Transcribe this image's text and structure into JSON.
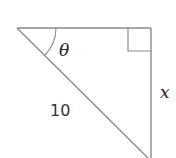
{
  "diagram": {
    "type": "right-triangle",
    "angle_label": "θ",
    "hypotenuse_label": "10",
    "opposite_label": "x",
    "stroke_color": "#8a8a8a",
    "right_angle_marker": true
  }
}
